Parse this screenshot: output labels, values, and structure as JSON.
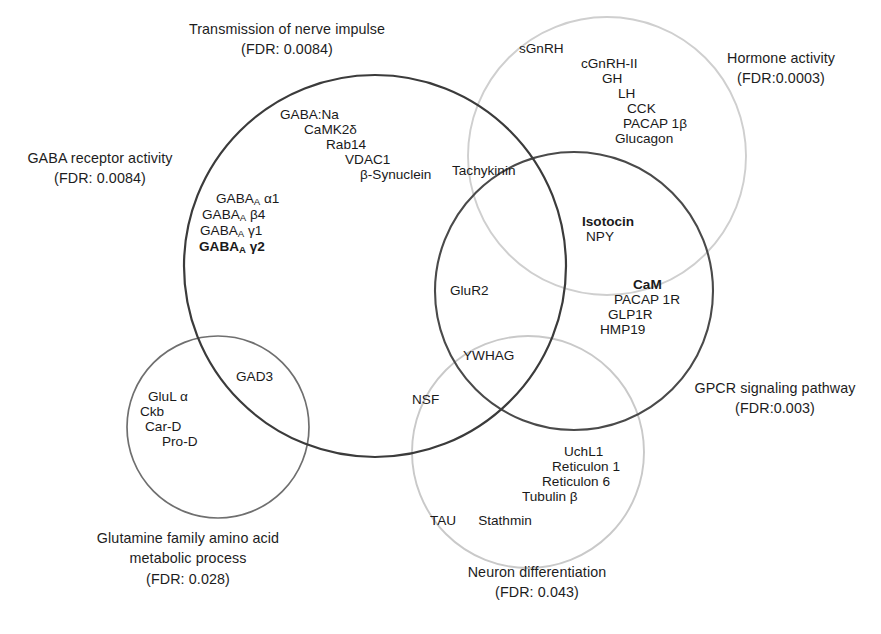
{
  "figure": {
    "type": "venn-diagram",
    "width": 881,
    "height": 634,
    "background": "#ffffff"
  },
  "colors": {
    "stroke_dark": "#3b3b3b",
    "stroke_medium": "#6f6f6f",
    "stroke_light": "#c9c9c9",
    "text": "#1d1d1d"
  },
  "sets": [
    {
      "id": "transmission",
      "name": "Transmission of nerve impulse",
      "fdr_label": "(FDR: 0.0084)",
      "stroke": "#3b3b3b",
      "stroke_width": 2.2,
      "cx": 375,
      "cy": 266,
      "r": 191
    },
    {
      "id": "gaba_receptor",
      "name": "GABA receptor activity",
      "fdr_label": "(FDR: 0.0084)",
      "stroke": "#3b3b3b",
      "stroke_width": 2.2,
      "cx": 375,
      "cy": 266,
      "r": 191
    },
    {
      "id": "hormone",
      "name": "Hormone activity",
      "fdr_label": "(FDR:0.0003)",
      "stroke": "#cfcfcf",
      "stroke_width": 1.9,
      "cx": 607,
      "cy": 156,
      "r": 139
    },
    {
      "id": "gpcr",
      "name": "GPCR signaling pathway",
      "fdr_label": "(FDR:0.003)",
      "stroke": "#4a4a4a",
      "stroke_width": 2.1,
      "cx": 574,
      "cy": 291,
      "r": 139
    },
    {
      "id": "glutamine",
      "name": "Glutamine family amino acid metabolic process",
      "name_line1": "Glutamine family amino acid",
      "name_line2": "metabolic process",
      "fdr_label": "(FDR: 0.028)",
      "stroke": "#6f6f6f",
      "stroke_width": 1.7,
      "cx": 218,
      "cy": 427,
      "r": 91
    },
    {
      "id": "neuron",
      "name": "Neuron differentiation",
      "fdr_label": "(FDR: 0.043)",
      "stroke": "#c9c9c9",
      "stroke_width": 1.9,
      "cx": 528,
      "cy": 452,
      "r": 116
    }
  ],
  "labels": {
    "transmission_line1": "Transmission of nerve impulse",
    "transmission_line2": "(FDR: 0.0084)",
    "gaba_line1": "GABA receptor activity",
    "gaba_line2": "(FDR: 0.0084)",
    "hormone_line1": "Hormone activity",
    "hormone_line2": "(FDR:0.0003)",
    "gpcr_line1": "GPCR signaling pathway",
    "gpcr_line2": "(FDR:0.003)",
    "glutamine_line1": "Glutamine family amino acid",
    "glutamine_line2": "metabolic process",
    "glutamine_line3": "(FDR: 0.028)",
    "neuron_line1": "Neuron differentiation",
    "neuron_line2": "(FDR: 0.043)"
  },
  "gene_groups": {
    "transmission_only": {
      "region": "Transmission of nerve impulse only",
      "items": [
        {
          "text": "GABA:Na",
          "bold": false
        },
        {
          "text": "CaMK2δ",
          "bold": false
        },
        {
          "text": "Rab14",
          "bold": false
        },
        {
          "text": "VDAC1",
          "bold": false
        },
        {
          "text": "β-Synuclein",
          "bold": false
        }
      ]
    },
    "gaba_receptor_only": {
      "region": "GABA receptor activity",
      "items": [
        {
          "prefix": "GABA",
          "sub": "A",
          "suffix": " α1",
          "bold": false
        },
        {
          "prefix": "GABA",
          "sub": "A",
          "suffix": " β4",
          "bold": false
        },
        {
          "prefix": "GABA",
          "sub": "A",
          "suffix": " γ1",
          "bold": false
        },
        {
          "prefix": "GABA",
          "sub": "A",
          "suffix": " γ2",
          "bold": true
        }
      ]
    },
    "hormone_only": {
      "region": "Hormone activity only",
      "items": [
        {
          "text": "sGnRH",
          "bold": false
        },
        {
          "text": "cGnRH-II",
          "bold": false
        },
        {
          "text": "GH",
          "bold": false
        },
        {
          "text": "LH",
          "bold": false
        },
        {
          "text": "CCK",
          "bold": false
        },
        {
          "text": "PACAP 1β",
          "bold": false
        },
        {
          "text": "Glucagon",
          "bold": false
        }
      ]
    },
    "transmission_hormone": {
      "region": "Transmission ∩ Hormone",
      "items": [
        {
          "text": "Tachykinin",
          "bold": false
        }
      ]
    },
    "hormone_gpcr": {
      "region": "Hormone ∩ GPCR",
      "items": [
        {
          "text": "Isotocin",
          "bold": true
        },
        {
          "text": "NPY",
          "bold": false
        }
      ]
    },
    "gpcr_only": {
      "region": "GPCR signaling pathway only",
      "items": [
        {
          "text": "CaM",
          "bold": true
        },
        {
          "text": "PACAP 1R",
          "bold": false
        },
        {
          "text": "GLP1R",
          "bold": false
        },
        {
          "text": "HMP19",
          "bold": false
        }
      ]
    },
    "transmission_gpcr": {
      "region": "Transmission ∩ GPCR",
      "items": [
        {
          "text": "GluR2",
          "bold": false
        }
      ]
    },
    "transmission_gpcr_neuron": {
      "region": "Transmission ∩ GPCR ∩ Neuron",
      "items": [
        {
          "text": "YWHAG",
          "bold": false
        }
      ]
    },
    "transmission_neuron": {
      "region": "Transmission ∩ Neuron differentiation",
      "items": [
        {
          "text": "NSF",
          "bold": false
        }
      ]
    },
    "transmission_glutamine": {
      "region": "Transmission ∩ Glutamine family",
      "items": [
        {
          "text": "GAD3",
          "bold": false
        }
      ]
    },
    "glutamine_only": {
      "region": "Glutamine family amino acid metabolic process only",
      "items": [
        {
          "text": "GluL α",
          "bold": false
        },
        {
          "text": "Ckb",
          "bold": false
        },
        {
          "text": "Car-D",
          "bold": false
        },
        {
          "text": "Pro-D",
          "bold": false
        }
      ]
    },
    "neuron_only": {
      "region": "Neuron differentiation only",
      "items": [
        {
          "text": "UchL1",
          "bold": false
        },
        {
          "text": "Reticulon 1",
          "bold": false
        },
        {
          "text": "Reticulon 6",
          "bold": false
        },
        {
          "text": "Tubulin β",
          "bold": false
        },
        {
          "text": "TAU",
          "bold": false
        },
        {
          "text": "Stathmin",
          "bold": false
        }
      ]
    }
  },
  "gene_text": {
    "t1": "GABA:Na",
    "t2": "CaMK2δ",
    "t3": "Rab14",
    "t4": "VDAC1",
    "t5": "β-Synuclein",
    "g_a1_pre": "GABA",
    "g_a1_sub": "A",
    "g_a1_suf": " α1",
    "g_b4_pre": "GABA",
    "g_b4_sub": "A",
    "g_b4_suf": " β4",
    "g_y1_pre": "GABA",
    "g_y1_sub": "A",
    "g_y1_suf": " γ1",
    "g_y2_pre": "GABA",
    "g_y2_sub": "A",
    "g_y2_suf": " γ2",
    "h1": "sGnRH",
    "h2": "cGnRH-II",
    "h3": "GH",
    "h4": "LH",
    "h5": "CCK",
    "h6": "PACAP 1β",
    "h7": "Glucagon",
    "tachykinin": "Tachykinin",
    "isotocin": "Isotocin",
    "npy": "NPY",
    "cam": "CaM",
    "pacap1r": "PACAP 1R",
    "glp1r": "GLP1R",
    "hmp19": "HMP19",
    "glur2": "GluR2",
    "ywhag": "YWHAG",
    "nsf": "NSF",
    "gad3": "GAD3",
    "glul": "GluL α",
    "ckb": "Ckb",
    "card": "Car-D",
    "prod": "Pro-D",
    "uchl1": "UchL1",
    "ret1": "Reticulon 1",
    "ret6": "Reticulon 6",
    "tubb": "Tubulin β",
    "tau": "TAU",
    "stathmin": "Stathmin"
  }
}
